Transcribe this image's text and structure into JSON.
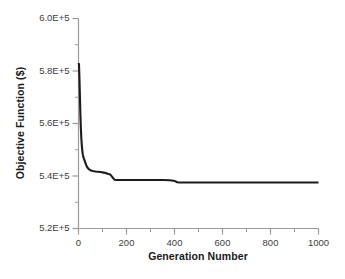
{
  "chart_data": {
    "type": "line",
    "title": "",
    "xlabel": "Generation Number",
    "ylabel": "Objective Function ($)",
    "xlim": [
      0,
      1000
    ],
    "ylim": [
      520000,
      600000
    ],
    "grid": false,
    "legend": "none",
    "x_ticks": [
      0,
      200,
      400,
      600,
      800,
      1000
    ],
    "x_tick_labels": [
      "0",
      "200",
      "400",
      "600",
      "800",
      "1000"
    ],
    "x_minor_interval": 100,
    "y_ticks": [
      520000,
      540000,
      560000,
      580000,
      600000
    ],
    "y_tick_labels": [
      "5.2E+5",
      "5.4E+5",
      "5.6E+5",
      "5.8E+5",
      "6.0E+5"
    ],
    "y_minor_interval": 10000,
    "line_color": "#1c1c1c",
    "line_width": 2.1,
    "series": [
      {
        "name": "Best objective value",
        "x": [
          0,
          2,
          4,
          6,
          8,
          10,
          12,
          14,
          16,
          18,
          20,
          22,
          25,
          28,
          32,
          36,
          40,
          46,
          52,
          60,
          70,
          80,
          92,
          105,
          118,
          132,
          142,
          148,
          150,
          160,
          200,
          250,
          300,
          350,
          380,
          395,
          402,
          405,
          412,
          420,
          500,
          600,
          700,
          800,
          900,
          1000
        ],
        "y": [
          583000,
          582600,
          577000,
          570000,
          563000,
          558000,
          554000,
          551500,
          549500,
          548200,
          547300,
          546700,
          546000,
          545200,
          544200,
          543400,
          542900,
          542400,
          542100,
          541900,
          541700,
          541600,
          541500,
          541300,
          541000,
          540600,
          539500,
          538800,
          538600,
          538500,
          538500,
          538500,
          538500,
          538500,
          538400,
          538200,
          538100,
          537900,
          537600,
          537500,
          537500,
          537500,
          537500,
          537500,
          537500,
          537500
        ]
      }
    ]
  },
  "axis": {
    "ylabel_text": "Objective Function ($)",
    "xlabel_text": "Generation Number"
  }
}
